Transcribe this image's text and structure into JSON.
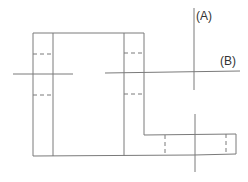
{
  "diagram": {
    "type": "technical-drawing",
    "labels": {
      "a": "(A)",
      "b": "(B)"
    },
    "colors": {
      "line": "#7a7a7a",
      "text": "#333333",
      "background": "#ffffff"
    }
  }
}
